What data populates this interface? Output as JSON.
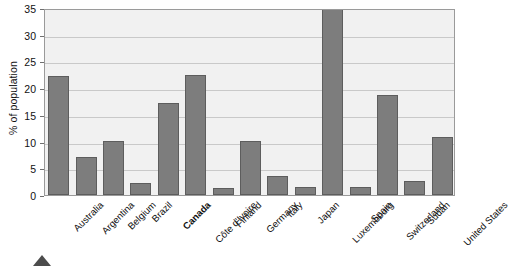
{
  "chart_data": {
    "type": "bar",
    "title": "",
    "subtitle": "",
    "xlabel": "",
    "ylabel": "% of population",
    "ylim": [
      0,
      35
    ],
    "ytick_step": 5,
    "yticks": [
      0,
      5,
      10,
      15,
      20,
      25,
      30,
      35
    ],
    "grid": true,
    "legend": "none",
    "categories": [
      "Australia",
      "Argentina",
      "Belgium",
      "Brazil",
      "Canada",
      "Côte d'Ivoire",
      "Finland",
      "Germany",
      "Italy",
      "Japan",
      "Luxembourg",
      "Spain",
      "Switzerland",
      "Sudan",
      "United States"
    ],
    "values": [
      22.2,
      7.2,
      10.2,
      2.3,
      17.3,
      22.5,
      1.4,
      10.2,
      3.5,
      1.5,
      35.0,
      1.5,
      18.8,
      2.6,
      10.8
    ],
    "emphasized_category": "Canada",
    "bar_color": "#7d7d7d",
    "bar_border_color": "#5d5d5d",
    "plot_background": "#f1f1f1",
    "gridline_color": "#c9c9c9",
    "axis_color": "#9a9a9a"
  },
  "marker": {
    "shape": "triangle-up",
    "color": "#4c4c4c"
  }
}
